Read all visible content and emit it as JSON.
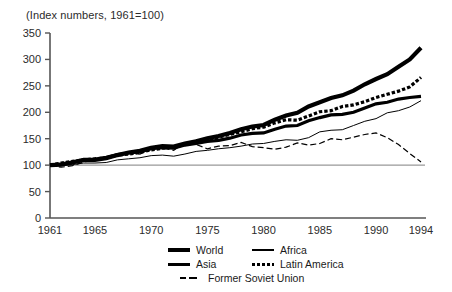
{
  "chart_data": {
    "type": "line",
    "title": "(Index numbers, 1961=100)",
    "subtitle": "",
    "xlabel": "",
    "ylabel": "",
    "xlim": [
      1961,
      1994
    ],
    "ylim": [
      0,
      350
    ],
    "yticks": [
      0,
      50,
      100,
      150,
      200,
      250,
      300,
      350
    ],
    "ytick_labels": [
      "0",
      "50",
      "100",
      "150",
      "200",
      "250",
      "300",
      "350"
    ],
    "xticks": [
      1961,
      1965,
      1970,
      1975,
      1980,
      1985,
      1990,
      1994
    ],
    "xtick_labels": [
      "1961",
      "1965",
      "1970",
      "1975",
      "1980",
      "1985",
      "1990",
      "1994"
    ],
    "grid": false,
    "reference_line": 100,
    "legend_position": "below-right",
    "x": [
      1961,
      1962,
      1963,
      1964,
      1965,
      1966,
      1967,
      1968,
      1969,
      1970,
      1971,
      1972,
      1973,
      1974,
      1975,
      1976,
      1977,
      1978,
      1979,
      1980,
      1981,
      1982,
      1983,
      1984,
      1985,
      1986,
      1987,
      1988,
      1989,
      1990,
      1991,
      1992,
      1993,
      1994
    ],
    "series": [
      {
        "name": "World",
        "style": "solid-thick",
        "values": [
          100,
          102,
          106,
          110,
          111,
          115,
          120,
          123,
          125,
          131,
          133,
          132,
          138,
          141,
          145,
          147,
          151,
          157,
          160,
          161,
          168,
          174,
          175,
          184,
          190,
          195,
          196,
          200,
          208,
          216,
          219,
          225,
          228,
          230
        ]
      },
      {
        "name": "Asia",
        "style": "solid-extra-thick",
        "values": [
          100,
          101,
          105,
          110,
          110,
          113,
          119,
          124,
          127,
          133,
          136,
          135,
          141,
          145,
          151,
          155,
          161,
          168,
          173,
          176,
          186,
          194,
          199,
          211,
          219,
          227,
          232,
          241,
          253,
          263,
          272,
          286,
          300,
          322
        ]
      },
      {
        "name": "Latin America",
        "style": "dotted-thick",
        "values": [
          100,
          104,
          107,
          110,
          112,
          114,
          119,
          121,
          124,
          129,
          132,
          134,
          139,
          145,
          148,
          153,
          158,
          163,
          169,
          172,
          180,
          186,
          185,
          193,
          201,
          203,
          211,
          214,
          220,
          228,
          234,
          240,
          248,
          266
        ]
      },
      {
        "name": "Africa",
        "style": "solid-thin",
        "values": [
          100,
          99,
          101,
          104,
          104,
          105,
          110,
          112,
          114,
          118,
          119,
          117,
          121,
          126,
          128,
          131,
          133,
          136,
          140,
          141,
          145,
          148,
          147,
          152,
          163,
          166,
          167,
          175,
          183,
          188,
          199,
          203,
          210,
          222
        ]
      },
      {
        "name": "Former Soviet Union",
        "style": "dashed-thin",
        "values": [
          100,
          96,
          99,
          106,
          109,
          116,
          118,
          124,
          121,
          131,
          133,
          128,
          142,
          139,
          131,
          136,
          137,
          143,
          135,
          133,
          130,
          134,
          142,
          138,
          141,
          150,
          148,
          153,
          158,
          161,
          152,
          139,
          122,
          106
        ]
      }
    ],
    "legend": [
      {
        "name": "World",
        "style": "solid-thick"
      },
      {
        "name": "Africa",
        "style": "solid-thin"
      },
      {
        "name": "Asia",
        "style": "solid-extra-thick"
      },
      {
        "name": "Latin America",
        "style": "dotted-thick"
      },
      {
        "name": "Former Soviet Union",
        "style": "dashed-thin"
      }
    ],
    "colors": {
      "series": "#000000",
      "axis": "#555555",
      "reference_line": "#999999",
      "text": "#2b2b2b",
      "background": "#ffffff"
    }
  }
}
